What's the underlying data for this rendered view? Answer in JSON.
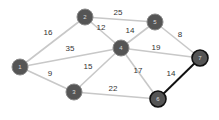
{
  "graph": {
    "nodes": [
      {
        "id": "1",
        "label": "1",
        "x": 20,
        "y": 67,
        "highlight": false
      },
      {
        "id": "2",
        "label": "2",
        "x": 85,
        "y": 17,
        "highlight": false
      },
      {
        "id": "3",
        "label": "3",
        "x": 74,
        "y": 92,
        "highlight": false
      },
      {
        "id": "4",
        "label": "4",
        "x": 121,
        "y": 48,
        "highlight": false
      },
      {
        "id": "5",
        "label": "5",
        "x": 155,
        "y": 22,
        "highlight": false
      },
      {
        "id": "6",
        "label": "6",
        "x": 158,
        "y": 99,
        "highlight": true
      },
      {
        "id": "7",
        "label": "7",
        "x": 200,
        "y": 58,
        "highlight": true
      }
    ],
    "edges": [
      {
        "from": "1",
        "to": "2",
        "weight": "16",
        "lx": 48,
        "ly": 35,
        "highlight": false
      },
      {
        "from": "1",
        "to": "4",
        "weight": "35",
        "lx": 70,
        "ly": 51,
        "highlight": false
      },
      {
        "from": "1",
        "to": "3",
        "weight": "9",
        "lx": 50,
        "ly": 76,
        "highlight": false
      },
      {
        "from": "2",
        "to": "5",
        "weight": "25",
        "lx": 118,
        "ly": 15,
        "highlight": false
      },
      {
        "from": "2",
        "to": "4",
        "weight": "12",
        "lx": 101,
        "ly": 30,
        "highlight": false
      },
      {
        "from": "3",
        "to": "4",
        "weight": "15",
        "lx": 88,
        "ly": 69,
        "highlight": false
      },
      {
        "from": "3",
        "to": "6",
        "weight": "22",
        "lx": 113,
        "ly": 91,
        "highlight": false
      },
      {
        "from": "4",
        "to": "5",
        "weight": "14",
        "lx": 130,
        "ly": 33,
        "highlight": false
      },
      {
        "from": "4",
        "to": "7",
        "weight": "19",
        "lx": 156,
        "ly": 50,
        "highlight": false
      },
      {
        "from": "4",
        "to": "6",
        "weight": "17",
        "lx": 138,
        "ly": 73,
        "highlight": false
      },
      {
        "from": "5",
        "to": "7",
        "weight": "8",
        "lx": 180,
        "ly": 37,
        "highlight": false
      },
      {
        "from": "6",
        "to": "7",
        "weight": "14",
        "lx": 171,
        "ly": 76,
        "highlight": true
      }
    ]
  },
  "colors": {
    "edge": "#c8c8c8",
    "edge_highlight": "#111111",
    "node_fill": "#555555",
    "node_stroke": "#888888",
    "node_stroke_highlight": "#111111",
    "label": "#333333"
  }
}
